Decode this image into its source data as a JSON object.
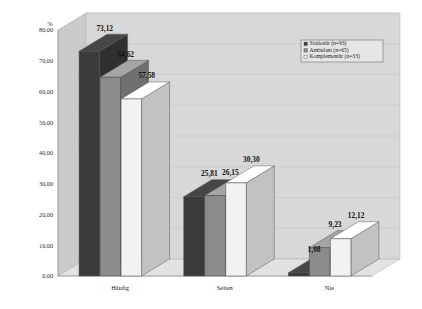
{
  "chart_data": {
    "type": "bar",
    "title": "",
    "subtitle": "",
    "xlabel": "",
    "ylabel": "%",
    "ylim": [
      0,
      80
    ],
    "yticks": [
      "0,00",
      "10,00",
      "20,00",
      "30,00",
      "40,00",
      "50,00",
      "60,00",
      "70,00",
      "80,00"
    ],
    "ytick_values": [
      0,
      10,
      20,
      30,
      40,
      50,
      60,
      70,
      80
    ],
    "grid": true,
    "legend_position": "top-right",
    "style": "3d-clustered-column",
    "categories": [
      "Häufig",
      "Selten",
      "Nie"
    ],
    "series": [
      {
        "name": "Stationär (n=93)",
        "color": "#3b3b3b",
        "values": [
          73.12,
          25.81,
          1.08
        ],
        "labels": [
          "73,12",
          "25,81",
          "1,08"
        ]
      },
      {
        "name": "Ambulant (n=65)",
        "color": "#8c8c8c",
        "values": [
          64.62,
          26.15,
          9.23
        ],
        "labels": [
          "64,62",
          "26,15",
          "9,23"
        ]
      },
      {
        "name": "Komplementär (n=33)",
        "color": "#f2f2f2",
        "values": [
          57.58,
          30.3,
          12.12
        ],
        "labels": [
          "57,58",
          "30,30",
          "12,12"
        ]
      }
    ]
  },
  "legend": {
    "items": [
      {
        "label": "Stationär (n=93)",
        "color": "#3b3b3b"
      },
      {
        "label": "Ambulant (n=65)",
        "color": "#8c8c8c"
      },
      {
        "label": "Komplementär (n=33)",
        "color": "#f2f2f2"
      }
    ]
  },
  "colors": {
    "background": "#ffffff",
    "wall": "#d8d8d8",
    "wall_side": "#cacaca",
    "floor": "#e2e2e2",
    "grid": "#c2c2c2",
    "axis": "#8a8a8a",
    "text": "#1a1a1a"
  }
}
